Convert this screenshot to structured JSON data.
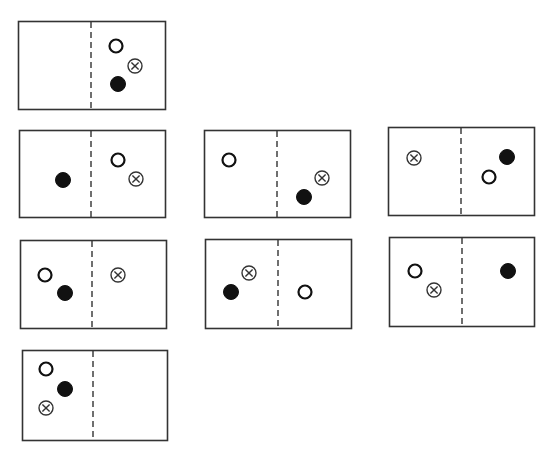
{
  "diagram": {
    "colors": {
      "stroke": "#333333",
      "fill": "#111111",
      "background": "#ffffff"
    },
    "marker_types": {
      "open": "open-circle",
      "filled": "filled-circle",
      "cross": "circled-cross"
    },
    "boxes": [
      {
        "id": "box-1",
        "x": 18,
        "y": 21,
        "w": 147,
        "h": 88,
        "divider_x": 91,
        "markers": [
          {
            "type": "open",
            "x": 116,
            "y": 46,
            "side": "right"
          },
          {
            "type": "cross",
            "x": 135,
            "y": 66,
            "side": "right"
          },
          {
            "type": "filled",
            "x": 118,
            "y": 84,
            "side": "right"
          }
        ]
      },
      {
        "id": "box-2",
        "x": 19,
        "y": 130,
        "w": 146,
        "h": 87,
        "divider_x": 91,
        "markers": [
          {
            "type": "filled",
            "x": 63,
            "y": 180,
            "side": "left"
          },
          {
            "type": "open",
            "x": 118,
            "y": 160,
            "side": "right"
          },
          {
            "type": "cross",
            "x": 136,
            "y": 179,
            "side": "right"
          }
        ]
      },
      {
        "id": "box-3",
        "x": 204,
        "y": 130,
        "w": 146,
        "h": 87,
        "divider_x": 277,
        "markers": [
          {
            "type": "open",
            "x": 229,
            "y": 160,
            "side": "left"
          },
          {
            "type": "cross",
            "x": 322,
            "y": 178,
            "side": "right"
          },
          {
            "type": "filled",
            "x": 304,
            "y": 197,
            "side": "right"
          }
        ]
      },
      {
        "id": "box-4",
        "x": 388,
        "y": 127,
        "w": 146,
        "h": 88,
        "divider_x": 461,
        "markers": [
          {
            "type": "cross",
            "x": 414,
            "y": 158,
            "side": "left"
          },
          {
            "type": "filled",
            "x": 507,
            "y": 157,
            "side": "right"
          },
          {
            "type": "open",
            "x": 489,
            "y": 177,
            "side": "right"
          }
        ]
      },
      {
        "id": "box-5",
        "x": 20,
        "y": 240,
        "w": 146,
        "h": 88,
        "divider_x": 92,
        "markers": [
          {
            "type": "open",
            "x": 45,
            "y": 275,
            "side": "left"
          },
          {
            "type": "filled",
            "x": 65,
            "y": 293,
            "side": "left"
          },
          {
            "type": "cross",
            "x": 118,
            "y": 275,
            "side": "right"
          }
        ]
      },
      {
        "id": "box-6",
        "x": 205,
        "y": 239,
        "w": 146,
        "h": 89,
        "divider_x": 278,
        "markers": [
          {
            "type": "cross",
            "x": 249,
            "y": 273,
            "side": "left"
          },
          {
            "type": "filled",
            "x": 231,
            "y": 292,
            "side": "left"
          },
          {
            "type": "open",
            "x": 305,
            "y": 292,
            "side": "right"
          }
        ]
      },
      {
        "id": "box-7",
        "x": 389,
        "y": 237,
        "w": 145,
        "h": 89,
        "divider_x": 462,
        "markers": [
          {
            "type": "open",
            "x": 415,
            "y": 271,
            "side": "left"
          },
          {
            "type": "cross",
            "x": 434,
            "y": 290,
            "side": "left"
          },
          {
            "type": "filled",
            "x": 508,
            "y": 271,
            "side": "right"
          }
        ]
      },
      {
        "id": "box-8",
        "x": 22,
        "y": 350,
        "w": 145,
        "h": 90,
        "divider_x": 93,
        "markers": [
          {
            "type": "open",
            "x": 46,
            "y": 369,
            "side": "left"
          },
          {
            "type": "filled",
            "x": 65,
            "y": 389,
            "side": "left"
          },
          {
            "type": "cross",
            "x": 46,
            "y": 408,
            "side": "left"
          }
        ]
      }
    ]
  }
}
